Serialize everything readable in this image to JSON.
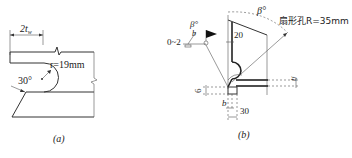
{
  "figure_a": {
    "caption": "(a)",
    "dim_width_label": "2t",
    "dim_width_subscript": "w",
    "radius_label": "r=19mm",
    "angle_label": "30°"
  },
  "figure_b": {
    "caption": "(b)",
    "beta_top_label": "β°",
    "beta_weld_label": "β°",
    "weld_b_label": "b",
    "weld_gap_label": "0~2",
    "scallop_label": "扇形孔R=35mm",
    "dim_20_label": "20",
    "dim_30_label": "30",
    "dim_6_label": "6",
    "dim_b_label": "b",
    "dim_t_label": "t",
    "dim_t_subscript": "f"
  }
}
